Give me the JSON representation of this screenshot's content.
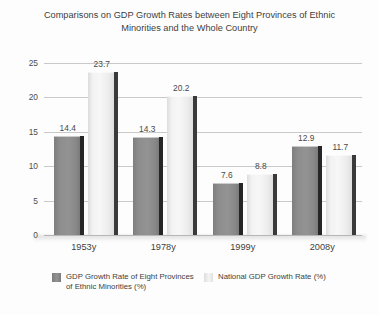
{
  "chart_data": {
    "type": "bar",
    "title": "Comparisons on GDP Growth Rates between Eight Provinces of Ethnic Minorities and the Whole Country",
    "title_lines": [
      "Comparisons on GDP Growth Rates between Eight Provinces of Ethnic",
      "Minorities and the Whole Country"
    ],
    "categories": [
      "1953y",
      "1978y",
      "1999y",
      "2008y"
    ],
    "series": [
      {
        "name": "GDP Growth Rate of Eight Provinces of Ethnic Minorities (%)",
        "name_lines": [
          "GDP Growth Rate of Eight Provinces",
          "of Ethnic Minorities (%)"
        ],
        "color": "#8d8d8d",
        "values": [
          14.4,
          14.3,
          7.6,
          12.9
        ],
        "labels": [
          "14.4",
          "14.3",
          "7.6",
          "12.9"
        ]
      },
      {
        "name": "National GDP Growth Rate (%)",
        "name_lines": [
          "National GDP Growth Rate (%)"
        ],
        "color": "#f0f0f0",
        "values": [
          23.7,
          20.2,
          8.8,
          11.7
        ],
        "labels": [
          "23.7",
          "20.2",
          "8.8",
          "11.7"
        ]
      }
    ],
    "xlabel": "",
    "ylabel": "",
    "ylim": [
      0,
      25
    ],
    "yticks": [
      0,
      5,
      10,
      15,
      20,
      25
    ],
    "ytick_labels": [
      "0",
      "5",
      "10",
      "15",
      "20",
      "25"
    ],
    "grid": true,
    "legend_position": "bottom"
  }
}
